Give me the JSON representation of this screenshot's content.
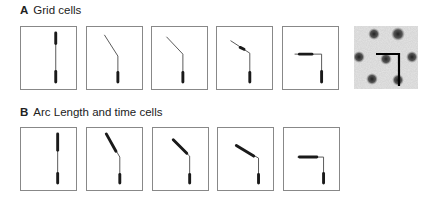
{
  "sections": [
    {
      "letter": "A",
      "title": "Grid cells"
    },
    {
      "letter": "B",
      "title": "Arc Length and time cells"
    }
  ],
  "row_a": {
    "panels": [
      {
        "id": "a1",
        "x": 20,
        "path": "M 36 6 L 36 57",
        "thick": [
          "M 36 6 L 36 17",
          "M 36 46 L 36 57"
        ]
      },
      {
        "id": "a2",
        "x": 86,
        "path": "M 18 8 L 32 30 L 32 57",
        "thick": [
          "M 32 47 L 32 57"
        ]
      },
      {
        "id": "a3",
        "x": 151,
        "path": "M 15 10 L 32 28 L 32 57",
        "thick": [
          "M 32 47 L 32 57"
        ]
      },
      {
        "id": "a4",
        "x": 216,
        "path": "M 14 14 L 34 27 L 34 57",
        "thick": [
          "M 24 21 L 28 23",
          "M 34 47 L 34 57"
        ]
      },
      {
        "id": "a5",
        "x": 282,
        "path": "M 12 28 L 40 28 L 40 57",
        "thick": [
          "M 17 28 L 30 28",
          "M 40 46 L 40 57"
        ]
      }
    ],
    "heatmap": {
      "label": "grid-cell-firing-map"
    }
  },
  "row_b": {
    "panels": [
      {
        "id": "b1",
        "x": 20,
        "path": "M 38 6 L 38 57",
        "thick": [
          "M 38 6 L 38 23",
          "M 38 47 L 38 57"
        ]
      },
      {
        "id": "b2",
        "x": 86,
        "path": "M 20 6 L 34 30 L 34 57",
        "thick": [
          "M 20 6 L 30 24",
          "M 34 48 L 34 57"
        ]
      },
      {
        "id": "b3",
        "x": 152,
        "path": "M 20 12 L 38 29 L 38 57",
        "thick": [
          "M 21 12 L 35 26",
          "M 38 48 L 38 57"
        ]
      },
      {
        "id": "b4",
        "x": 217,
        "path": "M 18 18 L 42 31 L 42 57",
        "thick": [
          "M 19 18 L 37 29",
          "M 42 48 L 42 57"
        ]
      },
      {
        "id": "b5",
        "x": 283,
        "path": "M 14 30 L 41 30 L 41 57",
        "thick": [
          "M 16 30 L 34 30",
          "M 41 47 L 41 57"
        ]
      }
    ]
  },
  "colors": {
    "stroke": "#555555",
    "thick": "#1a1a1a",
    "border": "#888888"
  }
}
